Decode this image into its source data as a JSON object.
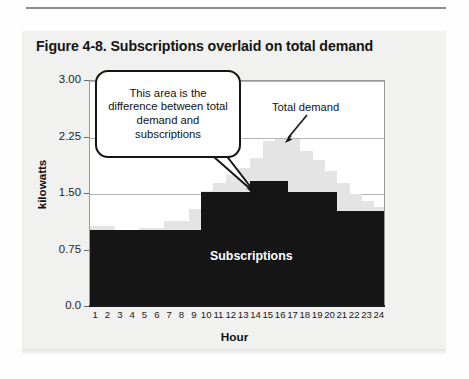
{
  "figure": {
    "title": "Figure 4-8. Subscriptions overlaid on total demand"
  },
  "annotations": {
    "total_demand": "Total demand",
    "subscriptions": "Subscriptions",
    "callout": "This area is the difference between total demand and subscriptions"
  },
  "chart_data": {
    "type": "bar",
    "title": "Figure 4-8. Subscriptions overlaid on total demand",
    "xlabel": "Hour",
    "ylabel": "kilowatts",
    "categories": [
      "1",
      "2",
      "3",
      "4",
      "5",
      "6",
      "7",
      "8",
      "9",
      "10",
      "11",
      "12",
      "13",
      "14",
      "15",
      "16",
      "17",
      "18",
      "19",
      "20",
      "21",
      "22",
      "23",
      "24"
    ],
    "series": [
      {
        "name": "Total demand",
        "color": "#e4e4e4",
        "values": [
          1.05,
          1.05,
          0.98,
          0.98,
          1.02,
          1.02,
          1.12,
          1.12,
          1.28,
          1.52,
          1.62,
          1.72,
          1.82,
          1.95,
          2.18,
          2.2,
          2.2,
          2.05,
          1.92,
          1.78,
          1.62,
          1.48,
          1.38,
          1.3
        ]
      },
      {
        "name": "Subscriptions",
        "color": "#151515",
        "values": [
          1.0,
          1.0,
          1.0,
          1.0,
          1.0,
          1.0,
          1.0,
          1.0,
          1.0,
          1.5,
          1.5,
          1.5,
          1.5,
          1.65,
          1.65,
          1.65,
          1.5,
          1.5,
          1.5,
          1.5,
          1.25,
          1.25,
          1.25,
          1.25
        ]
      }
    ],
    "ylim": [
      0,
      3.0
    ],
    "yticks": [
      "0.0",
      "0.75",
      "1.50",
      "2.25",
      "3.00"
    ],
    "ytick_values": [
      0,
      0.75,
      1.5,
      2.25,
      3.0
    ],
    "grid": true,
    "legend": "none",
    "annotations": [
      {
        "text": "Total demand",
        "type": "arrow-label",
        "points_to_hour": 16
      },
      {
        "text": "Subscriptions",
        "type": "inline-label"
      },
      {
        "text": "This area is the difference between total demand and subscriptions",
        "type": "callout"
      }
    ]
  }
}
